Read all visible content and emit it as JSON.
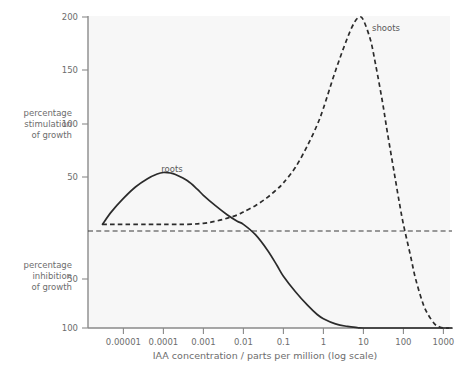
{
  "chart_data": {
    "type": "line",
    "title": "",
    "xlabel": "IAA concentration / parts per million (log scale)",
    "ylabel_upper": "percentage stimulation of growth",
    "ylabel_lower": "percentage inhibition of growth",
    "ylabel_upper_lines": [
      "percentage",
      "stimulation",
      "of growth"
    ],
    "ylabel_lower_lines": [
      "percentage",
      "inhibition",
      "of growth"
    ],
    "xscale": "log",
    "xlim": [
      3e-06,
      3000
    ],
    "ylim": [
      -100,
      200
    ],
    "grid": false,
    "legend": "inline-annotations",
    "zero_line": 0,
    "xticks": [
      1e-05,
      0.0001,
      0.001,
      0.01,
      0.1,
      1,
      10,
      100,
      1000
    ],
    "xtick_labels": [
      "0.00001",
      "0.0001",
      "0.001",
      "0.01",
      "0.1",
      "1",
      "10",
      "100",
      "1000"
    ],
    "yticks": [
      200,
      150,
      100,
      50,
      0,
      -50,
      -100
    ],
    "ytick_labels": [
      "200",
      "150",
      "100",
      "50",
      "",
      "50",
      "100"
    ],
    "series": [
      {
        "name": "roots",
        "style": "solid",
        "color": "#2b2b2b",
        "annotation": "roots",
        "points": [
          [
            3e-06,
            0
          ],
          [
            5e-06,
            12
          ],
          [
            1e-05,
            25
          ],
          [
            2e-05,
            36
          ],
          [
            4e-05,
            44
          ],
          [
            7e-05,
            48.5
          ],
          [
            0.0001,
            50
          ],
          [
            0.00015,
            49.5
          ],
          [
            0.0002,
            48
          ],
          [
            0.0004,
            42
          ],
          [
            0.0007,
            34
          ],
          [
            0.001,
            28
          ],
          [
            0.002,
            18
          ],
          [
            0.004,
            9
          ],
          [
            0.007,
            3
          ],
          [
            0.01,
            0
          ],
          [
            0.02,
            -10
          ],
          [
            0.04,
            -25
          ],
          [
            0.07,
            -40
          ],
          [
            0.1,
            -50
          ],
          [
            0.2,
            -65
          ],
          [
            0.4,
            -78
          ],
          [
            0.7,
            -87
          ],
          [
            1,
            -91
          ],
          [
            2,
            -96
          ],
          [
            4,
            -98.5
          ],
          [
            7,
            -99.6
          ],
          [
            10,
            -100
          ],
          [
            100,
            -100
          ],
          [
            1000,
            -100
          ],
          [
            3000,
            -100
          ]
        ]
      },
      {
        "name": "shoots",
        "style": "dashed",
        "color": "#2b2b2b",
        "annotation": "shoots",
        "points": [
          [
            3e-06,
            0
          ],
          [
            0.0001,
            0
          ],
          [
            0.0004,
            0
          ],
          [
            0.001,
            1
          ],
          [
            0.002,
            3
          ],
          [
            0.004,
            6
          ],
          [
            0.007,
            9
          ],
          [
            0.01,
            12
          ],
          [
            0.02,
            18
          ],
          [
            0.04,
            26
          ],
          [
            0.07,
            34
          ],
          [
            0.1,
            40
          ],
          [
            0.2,
            55
          ],
          [
            0.4,
            76
          ],
          [
            0.7,
            96
          ],
          [
            1,
            112
          ],
          [
            2,
            148
          ],
          [
            4,
            180
          ],
          [
            6,
            195
          ],
          [
            8,
            200
          ],
          [
            10,
            197
          ],
          [
            15,
            178
          ],
          [
            20,
            155
          ],
          [
            30,
            118
          ],
          [
            40,
            88
          ],
          [
            60,
            48
          ],
          [
            80,
            20
          ],
          [
            100,
            0
          ],
          [
            150,
            -30
          ],
          [
            200,
            -52
          ],
          [
            300,
            -75
          ],
          [
            400,
            -86
          ],
          [
            600,
            -96
          ],
          [
            800,
            -99
          ],
          [
            1000,
            -100
          ],
          [
            1400,
            -100
          ]
        ]
      }
    ]
  },
  "annotations": {
    "roots_label": "roots",
    "shoots_label": "shoots"
  },
  "colors": {
    "background": "#ffffff",
    "plot_background": "#f7f7f7",
    "axis": "#8a8a8a",
    "curve": "#2b2b2b",
    "text": "#6d6d6d",
    "zero_line": "#3a3a3a"
  }
}
